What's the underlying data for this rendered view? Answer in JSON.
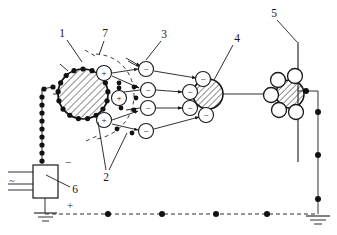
{
  "figure": {
    "background_color": "#ffffff",
    "line_color": "#1a1a1a",
    "width": 337,
    "height": 235
  },
  "callouts": [
    {
      "id": "1",
      "label": "1",
      "x": 62,
      "y": 33,
      "refers_to": "charged-drum-electrode",
      "leader": {
        "x1": 67,
        "y1": 40,
        "x2": 82,
        "y2": 62
      }
    },
    {
      "id": "2",
      "label": "2",
      "x": 106,
      "y": 177,
      "refers_to": "positive-ion-pair",
      "leaders": [
        {
          "x1": 106,
          "y1": 170,
          "x2": 98,
          "y2": 122
        },
        {
          "x1": 109,
          "y1": 170,
          "x2": 127,
          "y2": 133
        }
      ]
    },
    {
      "id": "3",
      "label": "3",
      "x": 164,
      "y": 34,
      "refers_to": "negative-ion",
      "leader": {
        "x1": 161,
        "y1": 41,
        "x2": 146,
        "y2": 60
      }
    },
    {
      "id": "4",
      "label": "4",
      "x": 237,
      "y": 38,
      "refers_to": "collector-particle",
      "leader": {
        "x1": 233,
        "y1": 45,
        "x2": 214,
        "y2": 80
      }
    },
    {
      "id": "5",
      "label": "5",
      "x": 274,
      "y": 13,
      "refers_to": "grounded-collector-plate",
      "leader": {
        "x1": 277,
        "y1": 20,
        "x2": 297,
        "y2": 42
      }
    },
    {
      "id": "6",
      "label": "6",
      "x": 75,
      "y": 189,
      "refers_to": "high-voltage-power-supply",
      "leader": {
        "x1": 70,
        "y1": 187,
        "x2": 46,
        "y2": 175
      }
    },
    {
      "id": "7",
      "label": "7",
      "x": 105,
      "y": 33,
      "refers_to": "corona-discharge-zone",
      "leader": {
        "x1": 104,
        "y1": 41,
        "x2": 99,
        "y2": 55
      }
    }
  ],
  "components": {
    "charged_drum": {
      "name": "hatched drum electrode",
      "cx": 83,
      "cy": 94,
      "r": 25,
      "perimeter_dot_count": 17,
      "perimeter_dot_r": 2.6
    },
    "collector_particle": {
      "name": "hatched collector particle",
      "cx": 208,
      "cy": 94,
      "r": 15
    },
    "deposit_particle": {
      "name": "hatched deposited particle",
      "cx": 290,
      "cy": 94,
      "r": 14
    },
    "power_supply": {
      "name": "high voltage DC supply",
      "x": 33,
      "y": 165,
      "w": 25,
      "h": 33
    },
    "collector_plate": {
      "name": "vertical collector plate",
      "x": 298,
      "y1": 42,
      "y2": 162
    },
    "return_conductor": {
      "name": "right return conductor",
      "x": 318,
      "y1": 90,
      "y2": 212
    }
  },
  "polarity_marks": [
    {
      "symbol": "−",
      "x": 68,
      "y": 162,
      "name": "negative-terminal-mark"
    },
    {
      "symbol": "+",
      "x": 70,
      "y": 205,
      "name": "positive-terminal-mark"
    },
    {
      "symbol": "~",
      "x": 12,
      "y": 180,
      "name": "ac-input-mark"
    }
  ],
  "positive_ions": [
    {
      "symbol": "+",
      "cx": 104,
      "cy": 73,
      "r": 7.5
    },
    {
      "symbol": "+",
      "cx": 119,
      "cy": 98,
      "r": 7.5
    },
    {
      "symbol": "+",
      "cx": 104,
      "cy": 120,
      "r": 7.5
    }
  ],
  "negative_ions_column": [
    {
      "symbol": "−",
      "cx": 146,
      "cy": 69,
      "r": 7.5
    },
    {
      "symbol": "−",
      "cx": 148,
      "cy": 90,
      "r": 7.5
    },
    {
      "symbol": "−",
      "cx": 148,
      "cy": 108,
      "r": 7.5
    },
    {
      "symbol": "−",
      "cx": 146,
      "cy": 131,
      "r": 7.5
    }
  ],
  "negative_ions_on_collector": [
    {
      "symbol": "−",
      "cx": 203,
      "cy": 79,
      "r": 7.5
    },
    {
      "symbol": "−",
      "cx": 190,
      "cy": 92,
      "r": 7.5
    },
    {
      "symbol": "−",
      "cx": 190,
      "cy": 108,
      "r": 7.5
    },
    {
      "symbol": "−",
      "cx": 206,
      "cy": 115,
      "r": 7.5
    }
  ],
  "neutral_circles_on_deposit": [
    {
      "cx": 278,
      "cy": 80,
      "r": 7.5
    },
    {
      "cx": 295,
      "cy": 76,
      "r": 7.5
    },
    {
      "cx": 271,
      "cy": 95,
      "r": 7.5
    },
    {
      "cx": 279,
      "cy": 110,
      "r": 7.5
    },
    {
      "cx": 296,
      "cy": 112,
      "r": 7.5
    }
  ],
  "free_charge_dots": [
    {
      "cx": 119,
      "cy": 88,
      "r": 2.4
    },
    {
      "cx": 134,
      "cy": 87,
      "r": 2.4
    },
    {
      "cx": 136,
      "cy": 98,
      "r": 2.4
    },
    {
      "cx": 121,
      "cy": 108,
      "r": 2.4
    },
    {
      "cx": 134,
      "cy": 110,
      "r": 2.4
    },
    {
      "cx": 117,
      "cy": 129,
      "r": 2.4
    },
    {
      "cx": 132,
      "cy": 133,
      "r": 2.4
    },
    {
      "cx": 119,
      "cy": 83,
      "r": 2.4
    }
  ],
  "bus_dots": [
    {
      "cx": 108,
      "cy": 214,
      "r": 3.0
    },
    {
      "cx": 162,
      "cy": 214,
      "r": 3.0
    },
    {
      "cx": 216,
      "cy": 214,
      "r": 3.0
    },
    {
      "cx": 267,
      "cy": 214,
      "r": 3.0
    }
  ],
  "conductor_dots": [
    {
      "cx": 306,
      "cy": 91,
      "r": 3.0
    },
    {
      "cx": 318,
      "cy": 112,
      "r": 3.0
    },
    {
      "cx": 318,
      "cy": 155,
      "r": 3.0
    },
    {
      "cx": 318,
      "cy": 199,
      "r": 3.0
    }
  ],
  "bead_lead": {
    "name": "beaded high voltage lead",
    "dot_r": 2.6,
    "points": [
      [
        53,
        87
      ],
      [
        44,
        89
      ],
      [
        42,
        97
      ],
      [
        42,
        105
      ],
      [
        42,
        113
      ],
      [
        42,
        121
      ],
      [
        42,
        129
      ],
      [
        42,
        137
      ],
      [
        42,
        145
      ],
      [
        42,
        153
      ],
      [
        42,
        161
      ]
    ]
  },
  "grounds": [
    {
      "name": "supply-ground",
      "x": 46,
      "y": 213
    },
    {
      "name": "plate-ground",
      "x": 318,
      "y": 213
    }
  ],
  "notes": {
    "dashed_bus_label": "dashed ground bus",
    "corona_arc_label": "dashed corona boundary"
  }
}
